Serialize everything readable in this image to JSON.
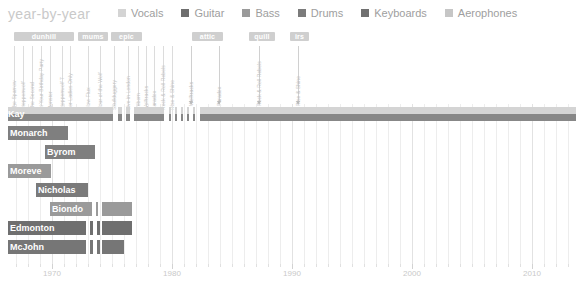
{
  "header": {
    "title": "year-by-year",
    "legend": [
      {
        "label": "Vocals",
        "color": "#d4d4d4"
      },
      {
        "label": "Guitar",
        "color": "#6e6e6e"
      },
      {
        "label": "Bass",
        "color": "#9a9a9a"
      },
      {
        "label": "Drums",
        "color": "#7b7b7b"
      },
      {
        "label": "Keyboards",
        "color": "#707070"
      },
      {
        "label": "Aerophones",
        "color": "#c6c6c6"
      }
    ]
  },
  "labels_bands": [
    {
      "name": "dunhill",
      "x": 14,
      "w": 60
    },
    {
      "name": "mums",
      "x": 78,
      "w": 30
    },
    {
      "name": "epic",
      "x": 111,
      "w": 31
    },
    {
      "name": "attic",
      "x": 192,
      "w": 31
    },
    {
      "name": "quill",
      "x": 249,
      "w": 26
    },
    {
      "name": "irs",
      "x": 290,
      "w": 19
    }
  ],
  "album_ticks": [
    {
      "title": "The Sparrow",
      "x": 14
    },
    {
      "title": "Steppenwolf",
      "x": 23
    },
    {
      "title": "The Second",
      "x": 32
    },
    {
      "title": "At Your Birthday Party",
      "x": 41
    },
    {
      "title": "Monster",
      "x": 50
    },
    {
      "title": "Steppenwolf 7",
      "x": 62
    },
    {
      "title": "For Ladies Only",
      "x": 70
    },
    {
      "title": "Slow Flux",
      "x": 88
    },
    {
      "title": "Hour of the Wolf",
      "x": 100
    },
    {
      "title": "Skullduggery",
      "x": 114
    },
    {
      "title": "Live in London",
      "x": 128
    },
    {
      "title": "Reborn",
      "x": 138
    },
    {
      "title": "Wolftracks",
      "x": 146
    },
    {
      "title": "Paradox",
      "x": 154
    },
    {
      "title": "Rock & Roll Rebels",
      "x": 163
    },
    {
      "title": "Rise & Shine",
      "x": 172
    }
  ],
  "album_arrows": [
    {
      "title": "Wolftracks",
      "x": 191
    },
    {
      "title": "Paradox",
      "x": 219
    },
    {
      "title": "Rock & Roll Rebels",
      "x": 259
    },
    {
      "title": "Rise & Shine",
      "x": 298
    }
  ],
  "chart_data": {
    "type": "bar",
    "title": "year-by-year",
    "xlabel": "",
    "ylabel": "",
    "xlim": [
      1966,
      2013
    ],
    "grid": true,
    "legend_position": "top",
    "px_per_year": 12.0,
    "x_origin_year": 1970,
    "x_origin_px": 52,
    "xticks": [
      1970,
      1980,
      1990,
      2000,
      2010
    ],
    "xticklabels": [
      "1970",
      "1980",
      "1990",
      "2000",
      "2010"
    ],
    "categories": [
      "Kay",
      "Monarch",
      "Byrom",
      "Moreve",
      "Nicholas",
      "Biondo",
      "Edmonton",
      "McJohn"
    ],
    "series": [
      {
        "name": "Kay",
        "label_x": 8,
        "instruments": [
          {
            "role": "Vocals",
            "color": "#d4d4d4",
            "segments": [
              {
                "x": 8,
                "w": 105
              },
              {
                "x": 118,
                "w": 4
              },
              {
                "x": 126,
                "w": 4
              },
              {
                "x": 134,
                "w": 30
              },
              {
                "x": 169,
                "w": 2
              },
              {
                "x": 175,
                "w": 2
              },
              {
                "x": 181,
                "w": 2
              },
              {
                "x": 187,
                "w": 2
              },
              {
                "x": 193,
                "w": 2
              },
              {
                "x": 200,
                "w": 376
              }
            ]
          },
          {
            "role": "Guitar",
            "color": "#878787",
            "segments": [
              {
                "x": 8,
                "w": 105
              },
              {
                "x": 118,
                "w": 4
              },
              {
                "x": 126,
                "w": 4
              },
              {
                "x": 134,
                "w": 30
              },
              {
                "x": 169,
                "w": 2
              },
              {
                "x": 175,
                "w": 2
              },
              {
                "x": 181,
                "w": 2
              },
              {
                "x": 187,
                "w": 2
              },
              {
                "x": 193,
                "w": 2
              },
              {
                "x": 200,
                "w": 376
              }
            ]
          }
        ]
      },
      {
        "name": "Monarch",
        "label_x": 10,
        "instruments": [
          {
            "role": "Bass",
            "color": "#7f7f7f",
            "segments": [
              {
                "x": 8,
                "w": 60
              }
            ]
          }
        ]
      },
      {
        "name": "Byrom",
        "label_x": 47,
        "instruments": [
          {
            "role": "Bass",
            "color": "#7f7f7f",
            "segments": [
              {
                "x": 45,
                "w": 50
              }
            ]
          }
        ]
      },
      {
        "name": "Moreve",
        "label_x": 10,
        "instruments": [
          {
            "role": "Bass",
            "color": "#9a9a9a",
            "segments": [
              {
                "x": 8,
                "w": 43
              }
            ]
          }
        ]
      },
      {
        "name": "Nicholas",
        "label_x": 38,
        "instruments": [
          {
            "role": "Guitar",
            "color": "#7a7a7a",
            "segments": [
              {
                "x": 36,
                "w": 52
              }
            ]
          }
        ]
      },
      {
        "name": "Biondo",
        "label_x": 52,
        "instruments": [
          {
            "role": "Bass",
            "color": "#9a9a9a",
            "segments": [
              {
                "x": 50,
                "w": 42
              },
              {
                "x": 96,
                "w": 2
              },
              {
                "x": 102,
                "w": 30
              }
            ]
          }
        ]
      },
      {
        "name": "Edmonton",
        "label_x": 10,
        "instruments": [
          {
            "role": "Drums",
            "color": "#6f6f6f",
            "segments": [
              {
                "x": 8,
                "w": 78
              },
              {
                "x": 90,
                "w": 3
              },
              {
                "x": 97,
                "w": 3
              },
              {
                "x": 102,
                "w": 30
              }
            ]
          }
        ]
      },
      {
        "name": "McJohn",
        "label_x": 10,
        "instruments": [
          {
            "role": "Keyboards",
            "color": "#767676",
            "segments": [
              {
                "x": 8,
                "w": 78
              },
              {
                "x": 90,
                "w": 3
              },
              {
                "x": 97,
                "w": 3
              },
              {
                "x": 102,
                "w": 22
              }
            ]
          }
        ]
      }
    ]
  },
  "colors": {
    "background": "#ffffff",
    "title": "#c9c9c9",
    "legend_text": "#9e9e9e",
    "pill": "#cfcfcf",
    "grid": "#ededed",
    "axis_text": "#c9c9c9"
  }
}
